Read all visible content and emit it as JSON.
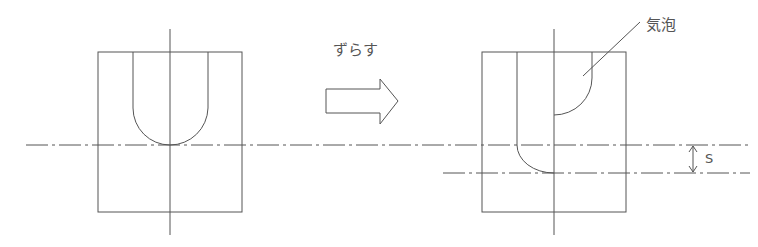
{
  "diagram": {
    "action_label": "ずらす",
    "bubble_label": "気泡",
    "offset_label": "S",
    "colors": {
      "line": "#555555",
      "text": "#555555",
      "background": "#ffffff"
    },
    "figures": [
      {
        "name": "before",
        "description": "U-shaped groove centered on axes"
      },
      {
        "name": "after",
        "description": "Halves shifted vertically by offset S, creating an air bubble"
      }
    ]
  }
}
